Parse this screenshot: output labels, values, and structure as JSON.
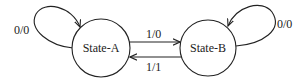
{
  "diagram": {
    "type": "state-machine",
    "states": [
      {
        "id": "A",
        "label": "State-A"
      },
      {
        "id": "B",
        "label": "State-B"
      }
    ],
    "transitions": [
      {
        "from": "A",
        "to": "A",
        "label": "0/0"
      },
      {
        "from": "A",
        "to": "B",
        "label": "1/0"
      },
      {
        "from": "B",
        "to": "A",
        "label": "1/1"
      },
      {
        "from": "B",
        "to": "B",
        "label": "0/0"
      }
    ],
    "colors": {
      "stroke": "#222222",
      "background": "#ffffff"
    }
  }
}
